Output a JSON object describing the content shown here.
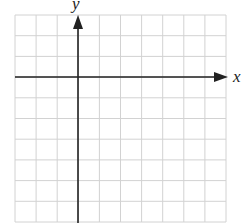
{
  "diagram": {
    "type": "coordinate-plane",
    "x_axis_label": "x",
    "y_axis_label": "y",
    "grid": {
      "columns": 10,
      "rows": 10,
      "left": 15,
      "top": 15,
      "right": 226,
      "bottom": 222,
      "line_color": "#d2d2d2"
    },
    "origin_px": {
      "x": 78,
      "y": 77
    },
    "axis_color": "#222222"
  }
}
